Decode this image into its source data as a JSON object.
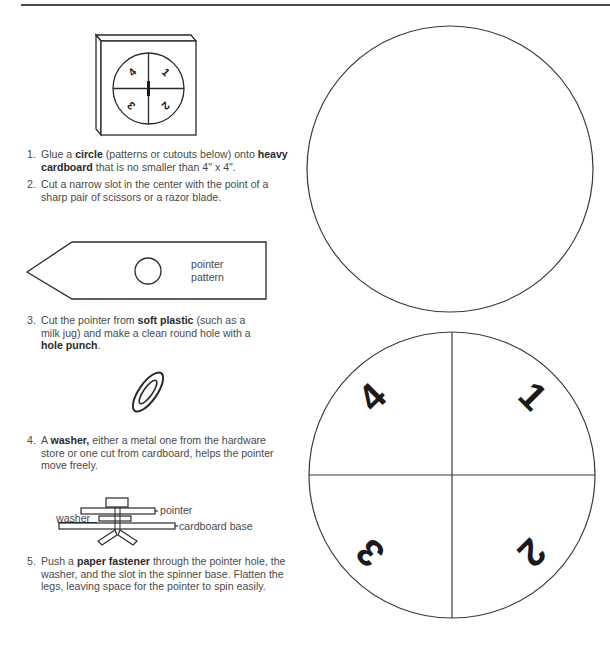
{
  "page": {
    "illustrations": {
      "spinner_board": {
        "numbers": [
          "4",
          "1",
          "2",
          "3"
        ]
      },
      "pointer_pattern": {
        "label_line1": "pointer",
        "label_line2": "pattern"
      },
      "washer": {
        "label": "washer"
      },
      "assembly": {
        "pointer_label": "pointer",
        "washer_label": "washer",
        "base_label": "cardboard base"
      }
    },
    "steps": [
      {
        "number": "1.",
        "parts": [
          {
            "text": "Glue a ",
            "bold": false
          },
          {
            "text": "circle",
            "bold": true
          },
          {
            "text": " (patterns or cutouts below) onto ",
            "bold": false
          },
          {
            "text": "heavy cardboard",
            "bold": true
          },
          {
            "text": " that is no smaller than 4\" x 4\".",
            "bold": false
          }
        ]
      },
      {
        "number": "2.",
        "parts": [
          {
            "text": "Cut a narrow slot in the center with the point of a sharp pair of scissors or a razor blade.",
            "bold": false
          }
        ]
      },
      {
        "number": "3.",
        "parts": [
          {
            "text": "Cut the pointer from ",
            "bold": false
          },
          {
            "text": "soft plastic",
            "bold": true
          },
          {
            "text": " (such as a milk jug) and make a clean round hole with a ",
            "bold": false
          },
          {
            "text": "hole punch",
            "bold": true
          },
          {
            "text": ".",
            "bold": false
          }
        ]
      },
      {
        "number": "4.",
        "parts": [
          {
            "text": "A ",
            "bold": false
          },
          {
            "text": "washer,",
            "bold": true
          },
          {
            "text": " either a metal one from the hardware store or one cut from cardboard, helps the pointer move freely.",
            "bold": false
          }
        ]
      },
      {
        "number": "5.",
        "parts": [
          {
            "text": "Push a ",
            "bold": false
          },
          {
            "text": "paper fastener",
            "bold": true
          },
          {
            "text": " through the pointer hole, the washer, and the slot in the spinner base. Flatten the legs, leaving space for the pointer to spin easily.",
            "bold": false
          }
        ]
      }
    ],
    "cutouts": {
      "blank_circle": {
        "numbers": []
      },
      "numbered_circle": {
        "numbers": [
          "4",
          "1",
          "2",
          "3"
        ]
      }
    }
  }
}
